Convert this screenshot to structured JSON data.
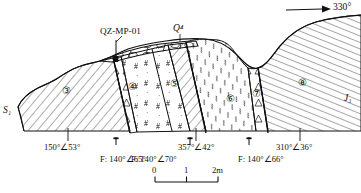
{
  "figure": {
    "kind": "geological-cross-section",
    "north_arrow": {
      "label": "330°",
      "icon": "arrow-right-icon"
    },
    "borehole": {
      "label": "QZ-MP-01"
    },
    "quaternary_label": "Q⁴",
    "strat_left": "S₁",
    "strat_right": "J₁",
    "unit_markers": [
      {
        "label": "③",
        "name": "unit-3"
      },
      {
        "label": "④",
        "name": "unit-4"
      },
      {
        "label": "⑤",
        "name": "unit-5"
      },
      {
        "label": "⑥",
        "name": "unit-6"
      },
      {
        "label": "⑦",
        "name": "unit-7"
      },
      {
        "label": "⑧",
        "name": "unit-8"
      }
    ],
    "measurements": [
      {
        "name": "bedding-attitude-1",
        "text": "150°∠53°"
      },
      {
        "name": "fault-attitude-1",
        "text": "F: 140°∠65°"
      },
      {
        "name": "bedding-attitude-2",
        "text": "357°∠42°"
      },
      {
        "name": "fault-attitude-2",
        "text": "F: 140°∠70°"
      },
      {
        "name": "bedding-attitude-3",
        "text": "310°∠36°"
      },
      {
        "name": "fault-attitude-3",
        "text": "F: 140°∠66°"
      }
    ],
    "scale_bar": {
      "ticks": [
        "0",
        "1",
        "2m"
      ]
    },
    "colors": {
      "ink": "#111111",
      "paper": "#ffffff"
    }
  }
}
